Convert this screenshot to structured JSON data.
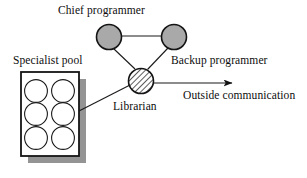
{
  "diagram": {
    "background_color": "#ffffff",
    "stroke_color": "#1a1a1a",
    "node_fill_color": "#a9a9a9",
    "shadow_color": "#8f8f8f",
    "labels": {
      "chief_programmer": "Chief programmer",
      "backup_programmer": "Backup programmer",
      "librarian": "Librarian",
      "specialist_pool": "Specialist pool",
      "outside_communication": "Outside communication"
    },
    "nodes": [
      {
        "id": "chief-programmer",
        "label": "Chief programmer",
        "cx": 109,
        "cy": 37,
        "r": 12.5,
        "fill": "gray"
      },
      {
        "id": "backup-programmer",
        "label": "Backup programmer",
        "cx": 174,
        "cy": 37,
        "r": 12.5,
        "fill": "gray"
      },
      {
        "id": "librarian",
        "label": "Librarian",
        "cx": 141,
        "cy": 81,
        "r": 12.5,
        "fill": "hatched"
      }
    ],
    "specialist_pool": {
      "label": "Specialist pool",
      "box": {
        "x": 21,
        "y": 72,
        "width": 58,
        "height": 84
      },
      "shadow_offset": 7,
      "specialist_count": 6,
      "columns": 2,
      "rows": 3
    },
    "connections": [
      {
        "from": "chief-programmer",
        "to": "backup-programmer",
        "type": "line"
      },
      {
        "from": "chief-programmer",
        "to": "librarian",
        "type": "line"
      },
      {
        "from": "backup-programmer",
        "to": "librarian",
        "type": "line"
      },
      {
        "from": "specialist-pool",
        "to": "librarian",
        "type": "line"
      },
      {
        "from": "librarian",
        "to": "outside",
        "type": "arrow",
        "label": "Outside communication"
      }
    ]
  }
}
